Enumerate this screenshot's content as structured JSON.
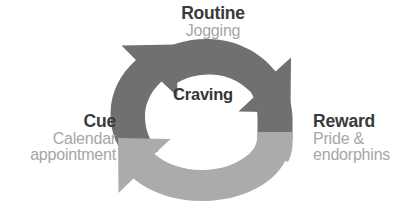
{
  "figure": {
    "name": "habit-loop-diagram",
    "type": "cycle-diagram",
    "background_color": "#ffffff"
  },
  "center": {
    "label": "Craving"
  },
  "stages": [
    {
      "id": "routine",
      "title": "Routine",
      "subtitle": "Jogging",
      "position": "top"
    },
    {
      "id": "reward",
      "title": "Reward",
      "subtitle_line1": "Pride &",
      "subtitle_line2": "endorphins",
      "position": "right"
    },
    {
      "id": "cue",
      "title": "Cue",
      "subtitle_line1": "Calendar",
      "subtitle_line2": "appointment",
      "position": "left"
    }
  ],
  "arrows": [
    {
      "id": "cue-to-routine",
      "name": "left-arrow-up",
      "color": "#6f6f6f",
      "direction": "upward-right"
    },
    {
      "id": "routine-to-reward",
      "name": "right-arrow-down",
      "color": "#6f6f6f",
      "direction": "downward-right"
    },
    {
      "id": "reward-to-cue",
      "name": "bottom-arrow-left",
      "color": "#ababab",
      "direction": "leftward-up"
    }
  ],
  "colors": {
    "arrow_dark": "#6f6f6f",
    "arrow_light": "#ababab",
    "title_text": "#3a3a3a",
    "subtitle_text": "#a6a6a6",
    "background": "#ffffff"
  }
}
